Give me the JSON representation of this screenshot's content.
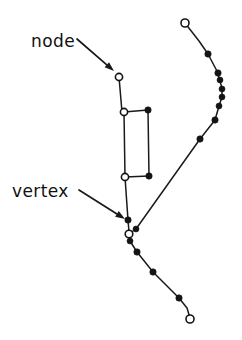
{
  "figure": {
    "width": 242,
    "height": 340,
    "background_color": "#ffffff",
    "stroke_color": "#1a1a1a",
    "open_marker_fill": "#ffffff",
    "filled_marker_fill": "#141414"
  },
  "annotations": [
    {
      "id": "node",
      "label": "node",
      "text_x": 31,
      "text_y": 47,
      "arrow_from_x": 77,
      "arrow_from_y": 39,
      "arrow_to_x": 114,
      "arrow_to_y": 71
    },
    {
      "id": "vertex",
      "label": "vertex",
      "text_x": 12,
      "text_y": 197,
      "arrow_from_x": 79,
      "arrow_from_y": 190,
      "arrow_to_x": 125,
      "arrow_to_y": 219
    }
  ],
  "chart_data": {
    "type": "scatter",
    "xlabel": "",
    "ylabel": "",
    "xlim": [
      0,
      242
    ],
    "ylim": [
      340,
      0
    ],
    "grid": false,
    "legend": "none",
    "annotations": [
      "node",
      "vertex"
    ],
    "paths": [
      {
        "name": "upper-stem",
        "points": [
          [
            119,
            77
          ],
          [
            122,
            112
          ]
        ]
      },
      {
        "name": "rect-top-edge",
        "points": [
          [
            124,
            112
          ],
          [
            148,
            110
          ]
        ]
      },
      {
        "name": "rect-right-edge",
        "points": [
          [
            148,
            110
          ],
          [
            149,
            176
          ]
        ]
      },
      {
        "name": "rect-bottom-edge",
        "points": [
          [
            125,
            177
          ],
          [
            149,
            176
          ]
        ]
      },
      {
        "name": "rect-left-edge",
        "points": [
          [
            124,
            112
          ],
          [
            125,
            177
          ]
        ]
      },
      {
        "name": "lower-stem-to-vertex",
        "points": [
          [
            125,
            177
          ],
          [
            128,
            220
          ],
          [
            129,
            232
          ]
        ]
      },
      {
        "name": "right-branch-to-vertex",
        "points": [
          [
            185,
            23
          ],
          [
            199,
            41
          ],
          [
            208,
            54
          ],
          [
            218,
            73
          ],
          [
            219,
            78
          ],
          [
            222,
            88
          ],
          [
            222,
            97
          ],
          [
            219,
            106
          ],
          [
            215,
            120
          ],
          [
            200,
            139
          ],
          [
            136,
            229
          ],
          [
            130,
            233
          ]
        ]
      },
      {
        "name": "vertex-to-bottom-tail",
        "points": [
          [
            129,
            234
          ],
          [
            130,
            241
          ],
          [
            137,
            252
          ],
          [
            153,
            272
          ],
          [
            179,
            298
          ],
          [
            187,
            308
          ],
          [
            190,
            318
          ]
        ]
      }
    ],
    "markers": [
      {
        "type": "open",
        "x": 119,
        "y": 77,
        "r": 3.6,
        "label": "node"
      },
      {
        "type": "open",
        "x": 124,
        "y": 112,
        "r": 3.6,
        "label": ""
      },
      {
        "type": "filled",
        "x": 148,
        "y": 110,
        "r": 3.2,
        "label": ""
      },
      {
        "type": "open",
        "x": 125,
        "y": 177,
        "r": 3.6,
        "label": ""
      },
      {
        "type": "filled",
        "x": 149,
        "y": 176,
        "r": 3.2,
        "label": ""
      },
      {
        "type": "filled",
        "x": 128,
        "y": 220,
        "r": 3.2,
        "label": ""
      },
      {
        "type": "filled",
        "x": 136,
        "y": 229,
        "r": 3.0,
        "label": ""
      },
      {
        "type": "open",
        "x": 129,
        "y": 234,
        "r": 3.8,
        "label": "vertex"
      },
      {
        "type": "filled",
        "x": 130,
        "y": 241,
        "r": 3.0,
        "label": ""
      },
      {
        "type": "filled",
        "x": 137,
        "y": 252,
        "r": 3.2,
        "label": ""
      },
      {
        "type": "filled",
        "x": 153,
        "y": 272,
        "r": 3.2,
        "label": ""
      },
      {
        "type": "filled",
        "x": 179,
        "y": 298,
        "r": 3.2,
        "label": ""
      },
      {
        "type": "open",
        "x": 190,
        "y": 319,
        "r": 4.0,
        "label": ""
      },
      {
        "type": "open",
        "x": 185,
        "y": 23,
        "r": 4.0,
        "label": ""
      },
      {
        "type": "filled",
        "x": 208,
        "y": 54,
        "r": 3.2,
        "label": ""
      },
      {
        "type": "filled",
        "x": 218,
        "y": 73,
        "r": 3.2,
        "label": ""
      },
      {
        "type": "filled",
        "x": 220,
        "y": 80,
        "r": 3.0,
        "label": ""
      },
      {
        "type": "filled",
        "x": 222,
        "y": 89,
        "r": 3.0,
        "label": ""
      },
      {
        "type": "filled",
        "x": 222,
        "y": 97,
        "r": 3.0,
        "label": ""
      },
      {
        "type": "filled",
        "x": 219,
        "y": 106,
        "r": 3.0,
        "label": ""
      },
      {
        "type": "filled",
        "x": 215,
        "y": 120,
        "r": 3.2,
        "label": ""
      },
      {
        "type": "filled",
        "x": 200,
        "y": 139,
        "r": 3.2,
        "label": ""
      }
    ]
  }
}
